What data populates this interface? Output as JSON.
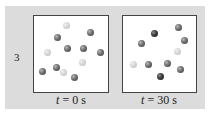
{
  "figure": {
    "row_label": "3",
    "panels": [
      {
        "caption_var": "t",
        "caption_rest": " = 0 s",
        "balls": [
          {
            "x": 66,
            "y": 25,
            "shade": "light"
          },
          {
            "x": 57,
            "y": 37,
            "shade": "dark"
          },
          {
            "x": 90,
            "y": 32,
            "shade": "dark"
          },
          {
            "x": 47,
            "y": 52,
            "shade": "light"
          },
          {
            "x": 67,
            "y": 48,
            "shade": "dark"
          },
          {
            "x": 83,
            "y": 48,
            "shade": "dark"
          },
          {
            "x": 100,
            "y": 52,
            "shade": "dark"
          },
          {
            "x": 82,
            "y": 62,
            "shade": "light"
          },
          {
            "x": 42,
            "y": 71,
            "shade": "dark"
          },
          {
            "x": 56,
            "y": 67,
            "shade": "dark"
          },
          {
            "x": 63,
            "y": 72,
            "shade": "light"
          },
          {
            "x": 74,
            "y": 77,
            "shade": "dark"
          }
        ]
      },
      {
        "caption_var": "t",
        "caption_rest": " = 30 s",
        "balls": [
          {
            "x": 154,
            "y": 33,
            "shade": "darker"
          },
          {
            "x": 178,
            "y": 27,
            "shade": "dark"
          },
          {
            "x": 141,
            "y": 43,
            "shade": "dark"
          },
          {
            "x": 184,
            "y": 40,
            "shade": "dark"
          },
          {
            "x": 177,
            "y": 51,
            "shade": "light"
          },
          {
            "x": 133,
            "y": 64,
            "shade": "light"
          },
          {
            "x": 148,
            "y": 64,
            "shade": "dark"
          },
          {
            "x": 167,
            "y": 63,
            "shade": "dark"
          },
          {
            "x": 160,
            "y": 76,
            "shade": "darker"
          },
          {
            "x": 180,
            "y": 69,
            "shade": "dark"
          }
        ]
      }
    ]
  }
}
